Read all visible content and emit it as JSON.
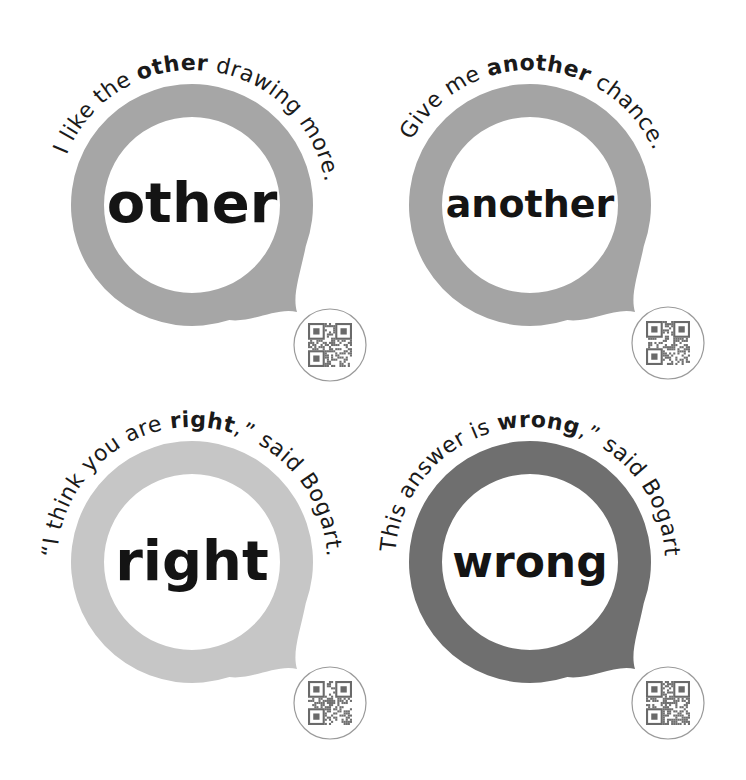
{
  "cards": [
    {
      "word": "other",
      "ring_color": "#a6a6a6",
      "sentence_pre": "I like the ",
      "sentence_bold": "other",
      "sentence_post": " drawing more.",
      "qr_icon": "qr-code-icon"
    },
    {
      "word": "another",
      "ring_color": "#a4a4a4",
      "sentence_pre": "Give me ",
      "sentence_bold": "another",
      "sentence_post": " chance.",
      "qr_icon": "qr-code-icon"
    },
    {
      "word": "right",
      "ring_color": "#c6c6c6",
      "sentence_pre": "“I think you are ",
      "sentence_bold": "right",
      "sentence_post": ",” said Bogart.",
      "qr_icon": "qr-code-icon"
    },
    {
      "word": "wrong",
      "ring_color": "#6f6f6f",
      "sentence_pre": "“This answer is ",
      "sentence_bold": "wrong",
      "sentence_post": ",” said Bogart.",
      "qr_icon": "qr-code-icon"
    }
  ]
}
